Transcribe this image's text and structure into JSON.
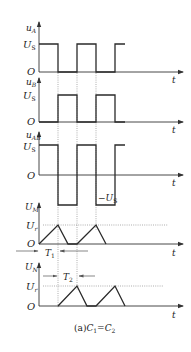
{
  "figure": {
    "caption": "(a)C₁=C₂",
    "caption_parts": {
      "prefix": "(a)",
      "lhs": "C",
      "lhs_sub": "1",
      "eq": "=",
      "rhs": "C",
      "rhs_sub": "2"
    },
    "time_axis_label": "t",
    "origin_label": "O"
  },
  "panels": [
    {
      "id": "uA",
      "y_label": "u",
      "y_label_sub": "A",
      "levels": [
        {
          "label": "U",
          "sub": "S"
        }
      ],
      "waveform": "square"
    },
    {
      "id": "uB",
      "y_label": "u",
      "y_label_sub": "B",
      "levels": [
        {
          "label": "U",
          "sub": "S"
        }
      ],
      "waveform": "square-inverted"
    },
    {
      "id": "uAB",
      "y_label": "u",
      "y_label_sub": "AB",
      "levels": [
        {
          "label": "U",
          "sub": "S"
        },
        {
          "label": "−U",
          "sub": "S"
        }
      ],
      "waveform": "bipolar-square"
    },
    {
      "id": "UM",
      "y_label": "U",
      "y_label_sub": "M",
      "levels": [
        {
          "label": "U",
          "sub": "r"
        }
      ],
      "waveform": "triangle",
      "interval": {
        "label": "T",
        "sub": "1"
      }
    },
    {
      "id": "UN",
      "y_label": "U",
      "y_label_sub": "N",
      "levels": [
        {
          "label": "U",
          "sub": "r"
        }
      ],
      "waveform": "triangle-delayed",
      "interval": {
        "label": "T",
        "sub": "2"
      }
    }
  ],
  "colors": {
    "line": "#2a2a2a",
    "guide": "#777777",
    "background": "#ffffff"
  }
}
